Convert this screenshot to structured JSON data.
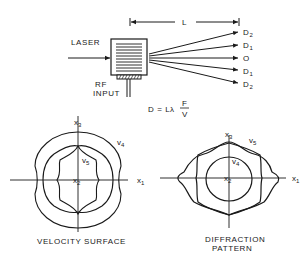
{
  "diagram": {
    "top": {
      "laser_label_1": "LASER",
      "laser_label_2": "BEAM",
      "rf_label_1": "RF",
      "rf_label_2": "INPUT",
      "length_label": "L",
      "orders": [
        {
          "base": "D",
          "sub": "2"
        },
        {
          "base": "D",
          "sub": "1"
        },
        {
          "base": "O",
          "sub": ""
        },
        {
          "base": "D",
          "sub": "1"
        },
        {
          "base": "D",
          "sub": "2"
        }
      ],
      "formula_lhs": "D = L",
      "formula_lambda": "λ",
      "formula_num": "F",
      "formula_den": "V"
    },
    "left": {
      "caption": "VELOCITY SURFACE",
      "x3": {
        "base": "x",
        "sub": "3"
      },
      "x2": {
        "base": "x",
        "sub": "2"
      },
      "x1": {
        "base": "x",
        "sub": "1"
      },
      "v4": {
        "base": "v",
        "sub": "4"
      },
      "v5": {
        "base": "v",
        "sub": "5"
      }
    },
    "right": {
      "caption_1": "DIFFRACTION",
      "caption_2": "PATTERN",
      "x3": {
        "base": "x",
        "sub": "3"
      },
      "x2": {
        "base": "x",
        "sub": "2"
      },
      "x1": {
        "base": "x",
        "sub": "1"
      },
      "v5": {
        "base": "v",
        "sub": "5"
      },
      "v4": {
        "base": "v",
        "sub": "4"
      }
    }
  }
}
